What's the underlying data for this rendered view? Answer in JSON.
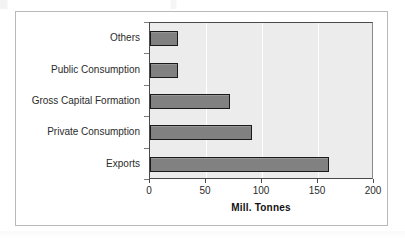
{
  "chart_data": {
    "type": "bar",
    "orientation": "horizontal",
    "title": "",
    "subtitle": "",
    "xlabel": "Mill. Tonnes",
    "ylabel": "",
    "xlim": [
      0,
      200
    ],
    "xticks": [
      0,
      50,
      100,
      150,
      200
    ],
    "xtick_labels": [
      "0",
      "50",
      "100",
      "150",
      "200"
    ],
    "grid": "vertical",
    "legend": "none",
    "categories": [
      "Others",
      "Public Consumption",
      "Gross Capital Formation",
      "Private Consumption",
      "Exports"
    ],
    "values": [
      25,
      25,
      71,
      91,
      160
    ],
    "series": [
      {
        "name": "Mill. Tonnes",
        "values": [
          25,
          25,
          71,
          91,
          160
        ]
      }
    ],
    "bar_fill_color": "#818181",
    "bar_border_color": "#1a1a1a",
    "plot_background_color": "#ececec",
    "gridline_color": "#ffffff",
    "frame_border_color": "#b9b9b9",
    "axis_color": "#4a4a4a",
    "text_color": "#2b2b2b"
  }
}
